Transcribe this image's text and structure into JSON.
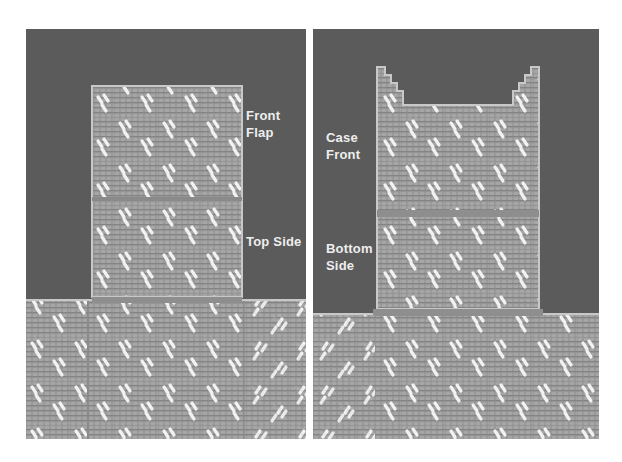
{
  "figure": {
    "left_photo": {
      "description": "Plastic canvas pieces laid out: front flap, top side, and lower body",
      "labels": [
        {
          "line1": "Front",
          "line2": "Flap"
        },
        {
          "line1": "Top Side"
        }
      ]
    },
    "right_photo": {
      "description": "Plastic canvas pieces laid out: case front with ears, bottom side, and lower body",
      "labels": [
        {
          "line1": "Case",
          "line2": "Front"
        },
        {
          "line1": "Bottom",
          "line2": "Side"
        }
      ]
    },
    "colors": {
      "background": "#5b5b5b",
      "canvas": "#9a9a9a",
      "canvas_edge": "#c8c8c8",
      "stitch_highlight": "#f2f2f2",
      "divider": "#ffffff"
    }
  }
}
